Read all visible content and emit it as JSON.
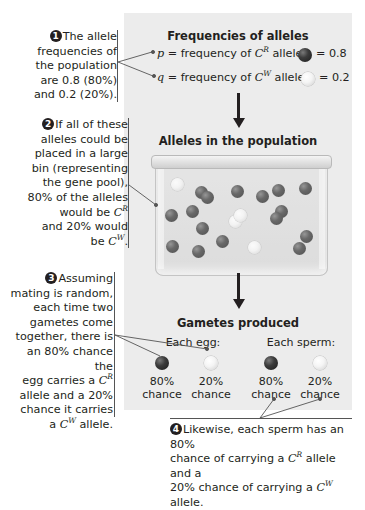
{
  "panel": {
    "background": "#ececec"
  },
  "notes": [
    {
      "number": "1",
      "lines": [
        "The allele",
        "frequencies of",
        "the population",
        "are 0.8 (80%)",
        "and 0.2 (20%)."
      ]
    },
    {
      "number": "2",
      "lines": [
        "If all of these",
        "alleles could be",
        "placed in a large",
        "bin (representing",
        "the gene pool),",
        "80% of the alleles",
        "would be C^R",
        "and 20% would",
        "be C^W."
      ]
    },
    {
      "number": "3",
      "lines": [
        "Assuming",
        "mating is random,",
        "each time two",
        "gametes come",
        "together, there is",
        "an 80% chance the",
        "egg carries a C^R",
        "allele and a 20%",
        "chance it carries",
        "a C^W allele."
      ]
    },
    {
      "number": "4",
      "lines": [
        "Likewise, each sperm has an 80%",
        "chance of carrying a C^R allele and a",
        "20% chance of carrying a C^W allele."
      ]
    }
  ],
  "frequencies": {
    "title": "Frequencies of alleles",
    "p": {
      "symbol": "p",
      "text": "= frequency of",
      "allele_base": "C",
      "allele_sup": "R",
      "word": "allele",
      "value": "= 0.8",
      "ball": "dark"
    },
    "q": {
      "symbol": "q",
      "text": "= frequency of",
      "allele_base": "C",
      "allele_sup": "W",
      "word": "allele",
      "value": "= 0.2",
      "ball": "light"
    }
  },
  "population": {
    "title": "Alleles in the population",
    "dark_count": 16,
    "light_count": 4
  },
  "gametes": {
    "title": "Gametes produced",
    "egg_label": "Each egg:",
    "sperm_label": "Each sperm:",
    "egg": [
      {
        "pct": "80%",
        "word": "chance",
        "ball": "dark"
      },
      {
        "pct": "20%",
        "word": "chance",
        "ball": "light"
      }
    ],
    "sperm": [
      {
        "pct": "80%",
        "word": "chance",
        "ball": "dark"
      },
      {
        "pct": "20%",
        "word": "chance",
        "ball": "light"
      }
    ]
  },
  "colors": {
    "dark_allele": "#2a2a2a",
    "light_allele": "#f4f4f4",
    "text": "#231f20"
  }
}
